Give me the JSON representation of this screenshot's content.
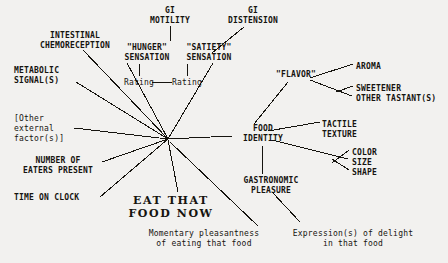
{
  "diagram": {
    "background_color": "#f2f1ef",
    "ink_color": "#16140f",
    "hub": {
      "x": 168,
      "y": 139,
      "label": ""
    },
    "nodes": [
      {
        "id": "gi-motility",
        "text": "GI\nMOTILITY",
        "x": 140,
        "y": 6,
        "w": 60,
        "align": "center",
        "style": "caps"
      },
      {
        "id": "gi-distension",
        "text": "GI\nDISTENSION",
        "x": 216,
        "y": 6,
        "w": 74,
        "align": "center",
        "style": "caps"
      },
      {
        "id": "intestinal-chemoreception",
        "text": "INTESTINAL\nCHEMORECEPTION",
        "x": 22,
        "y": 31,
        "w": 106,
        "align": "center",
        "style": "caps"
      },
      {
        "id": "hunger-sensation",
        "text": "\"HUNGER\"\nSENSATION",
        "x": 116,
        "y": 43,
        "w": 62,
        "align": "center",
        "style": "caps"
      },
      {
        "id": "satiety-sensation",
        "text": "\"SATIETY\"\nSENSATION",
        "x": 178,
        "y": 43,
        "w": 62,
        "align": "center",
        "style": "caps"
      },
      {
        "id": "metabolic-signals",
        "text": "METABOLIC\nSIGNAL(S)",
        "x": 14,
        "y": 66,
        "w": 80,
        "align": "left",
        "style": "caps"
      },
      {
        "id": "rating-hunger",
        "text": "Rating",
        "x": 118,
        "y": 78,
        "w": 42,
        "align": "center",
        "style": "mixed"
      },
      {
        "id": "rating-satiety",
        "text": "Rating",
        "x": 166,
        "y": 78,
        "w": 42,
        "align": "center",
        "style": "mixed"
      },
      {
        "id": "flavor",
        "text": "\"FLAVOR\"",
        "x": 268,
        "y": 70,
        "w": 56,
        "align": "center",
        "style": "caps"
      },
      {
        "id": "aroma",
        "text": "AROMA",
        "x": 356,
        "y": 62,
        "w": 50,
        "align": "left",
        "style": "caps"
      },
      {
        "id": "sweetener",
        "text": "SWEETENER",
        "x": 356,
        "y": 84,
        "w": 70,
        "align": "left",
        "style": "caps"
      },
      {
        "id": "other-tastants",
        "text": "OTHER TASTANT(S)",
        "x": 356,
        "y": 94,
        "w": 92,
        "align": "left",
        "style": "caps"
      },
      {
        "id": "other-external-factors",
        "text": "[Other\nexternal\nfactor(s)]",
        "x": 14,
        "y": 114,
        "w": 70,
        "align": "left",
        "style": "mixed"
      },
      {
        "id": "food-identity",
        "text": "FOOD\nIDENTITY",
        "x": 232,
        "y": 124,
        "w": 62,
        "align": "center",
        "style": "caps"
      },
      {
        "id": "tactile-texture",
        "text": "TACTILE\nTEXTURE",
        "x": 322,
        "y": 120,
        "w": 60,
        "align": "left",
        "style": "caps"
      },
      {
        "id": "color",
        "text": "COLOR",
        "x": 352,
        "y": 148,
        "w": 46,
        "align": "left",
        "style": "caps"
      },
      {
        "id": "size",
        "text": "SIZE",
        "x": 352,
        "y": 158,
        "w": 46,
        "align": "left",
        "style": "caps"
      },
      {
        "id": "shape",
        "text": "SHAPE",
        "x": 352,
        "y": 168,
        "w": 46,
        "align": "left",
        "style": "caps"
      },
      {
        "id": "number-of-eaters",
        "text": "NUMBER OF\nEATERS PRESENT",
        "x": 10,
        "y": 156,
        "w": 96,
        "align": "center",
        "style": "caps"
      },
      {
        "id": "gastronomic-pleasure",
        "text": "GASTRONOMIC\nPLEASURE",
        "x": 228,
        "y": 176,
        "w": 86,
        "align": "center",
        "style": "caps"
      },
      {
        "id": "time-on-clock",
        "text": "TIME ON CLOCK",
        "x": 14,
        "y": 193,
        "w": 84,
        "align": "left",
        "style": "caps"
      },
      {
        "id": "eat-that-food-now",
        "text": "EAT THAT\nFOOD NOW",
        "x": 122,
        "y": 194,
        "w": 98,
        "align": "center",
        "style": "center-cta"
      },
      {
        "id": "momentary-pleasantness",
        "text": "Momentary pleasantness\nof eating that food",
        "x": 136,
        "y": 229,
        "w": 136,
        "align": "center",
        "style": "mixed"
      },
      {
        "id": "expression-of-delight",
        "text": "Expression(s) of delight\nin that food",
        "x": 280,
        "y": 229,
        "w": 146,
        "align": "center",
        "style": "mixed"
      }
    ],
    "edges": [
      {
        "id": "gi-motility--hunger",
        "from": "gi-motility",
        "to": "hunger-sensation",
        "x1": 170,
        "y1": 26,
        "x2": 170,
        "y2": 41
      },
      {
        "id": "hunger--rating",
        "from": "hunger-sensation",
        "to": "rating-hunger",
        "x1": 139,
        "y1": 64,
        "x2": 139,
        "y2": 76
      },
      {
        "id": "satiety--rating",
        "from": "satiety-sensation",
        "to": "rating-satiety",
        "x1": 187,
        "y1": 64,
        "x2": 187,
        "y2": 76
      },
      {
        "id": "rating--rating",
        "from": "rating-hunger",
        "to": "rating-satiety",
        "x1": 152,
        "y1": 82,
        "x2": 172,
        "y2": 82
      },
      {
        "id": "gi-distension--satiety",
        "from": "gi-distension",
        "to": "satiety-sensation",
        "x1": 244,
        "y1": 27,
        "x2": 212,
        "y2": 53
      },
      {
        "id": "hunger--hub",
        "from": "hunger-sensation",
        "to": "hub",
        "x1": 127,
        "y1": 63,
        "x2": 168,
        "y2": 139
      },
      {
        "id": "satiety--hub",
        "from": "satiety-sensation",
        "to": "hub",
        "x1": 213,
        "y1": 63,
        "x2": 168,
        "y2": 139
      },
      {
        "id": "chemoreception--hub",
        "from": "intestinal-chemoreception",
        "to": "hub",
        "x1": 83,
        "y1": 50,
        "x2": 168,
        "y2": 139
      },
      {
        "id": "metabolic--hub",
        "from": "metabolic-signals",
        "to": "hub",
        "x1": 76,
        "y1": 82,
        "x2": 168,
        "y2": 139
      },
      {
        "id": "external-factors--hub",
        "from": "other-external-factors",
        "to": "hub",
        "x1": 74,
        "y1": 128,
        "x2": 168,
        "y2": 139
      },
      {
        "id": "eaters-present--hub",
        "from": "number-of-eaters",
        "to": "hub",
        "x1": 102,
        "y1": 162,
        "x2": 168,
        "y2": 139
      },
      {
        "id": "time-on-clock--hub",
        "from": "time-on-clock",
        "to": "hub",
        "x1": 100,
        "y1": 197,
        "x2": 168,
        "y2": 139
      },
      {
        "id": "hub--food-identity",
        "from": "hub",
        "to": "food-identity",
        "x1": 168,
        "y1": 139,
        "x2": 232,
        "y2": 136
      },
      {
        "id": "flavor--food-identity",
        "from": "flavor",
        "to": "food-identity",
        "x1": 288,
        "y1": 82,
        "x2": 254,
        "y2": 124
      },
      {
        "id": "flavor--aroma",
        "from": "flavor",
        "to": "aroma",
        "x1": 310,
        "y1": 78,
        "x2": 353,
        "y2": 64
      },
      {
        "id": "flavor--tastants-stem",
        "from": "flavor",
        "to": "other-tastants",
        "x1": 310,
        "y1": 80,
        "x2": 352,
        "y2": 96
      },
      {
        "id": "tastants--sweetener",
        "from": "other-tastants",
        "to": "sweetener",
        "x1": 336,
        "y1": 92,
        "x2": 353,
        "y2": 86
      },
      {
        "id": "food-identity--tactile",
        "from": "food-identity",
        "to": "tactile-texture",
        "x1": 268,
        "y1": 131,
        "x2": 320,
        "y2": 122
      },
      {
        "id": "food-identity--attributes",
        "from": "food-identity",
        "to": "size",
        "x1": 272,
        "y1": 140,
        "x2": 348,
        "y2": 159
      },
      {
        "id": "attributes--color",
        "from": "size",
        "to": "color",
        "x1": 332,
        "y1": 163,
        "x2": 349,
        "y2": 150
      },
      {
        "id": "attributes--shape",
        "from": "size",
        "to": "shape",
        "x1": 332,
        "y1": 159,
        "x2": 349,
        "y2": 170
      },
      {
        "id": "food-identity--gastronomic",
        "from": "food-identity",
        "to": "gastronomic-pleasure",
        "x1": 262,
        "y1": 146,
        "x2": 262,
        "y2": 174
      },
      {
        "id": "hub--eat-that-food-now",
        "from": "hub",
        "to": "eat-that-food-now",
        "x1": 168,
        "y1": 140,
        "x2": 178,
        "y2": 192
      },
      {
        "id": "hub--momentary-pleasantness",
        "from": "hub",
        "to": "momentary-pleasantness",
        "x1": 170,
        "y1": 142,
        "x2": 258,
        "y2": 226
      },
      {
        "id": "gastronomic--expression",
        "from": "gastronomic-pleasure",
        "to": "expression-of-delight",
        "x1": 272,
        "y1": 192,
        "x2": 300,
        "y2": 222
      }
    ]
  }
}
